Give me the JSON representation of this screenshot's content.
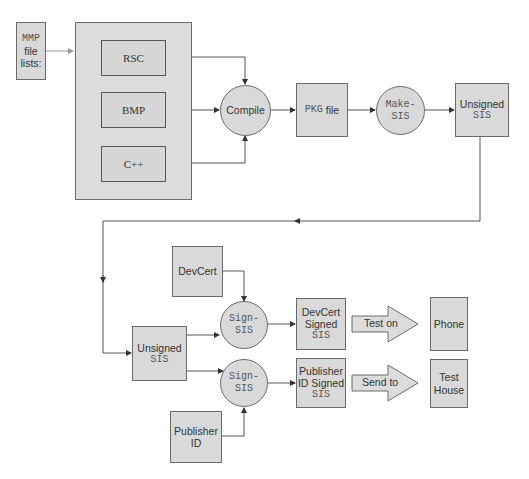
{
  "diagram": {
    "colors": {
      "node_fill": "#d9d9d9",
      "border": "#6b6b6b",
      "line": "#555555",
      "text": "#333333"
    },
    "nodes": {
      "mmp": {
        "line1": "MMP",
        "line2": "file",
        "line3": "lists:"
      },
      "rsc": {
        "label": "RSC"
      },
      "bmp": {
        "label": "BMP"
      },
      "cpp": {
        "label": "C++"
      },
      "compile": {
        "label": "Compile"
      },
      "pkg": {
        "mono": "PKG",
        "label": "file"
      },
      "makesis": {
        "line1": "Make-",
        "line2": "SIS"
      },
      "unsigned_top": {
        "line1": "Unsigned",
        "line2": "SIS"
      },
      "devcert": {
        "label": "DevCert"
      },
      "unsigned_bottom": {
        "line1": "Unsigned",
        "line2": "SIS"
      },
      "signsis_top": {
        "line1": "Sign-",
        "line2": "SIS"
      },
      "signsis_bottom": {
        "line1": "Sign-",
        "line2": "SIS"
      },
      "publisher_id": {
        "line1": "Publisher",
        "line2": "ID"
      },
      "devcert_signed": {
        "line1": "DevCert",
        "line2": "Signed",
        "line3": "SIS"
      },
      "publisher_signed": {
        "line1": "Publisher",
        "line2": "ID Signed",
        "line3": "SIS"
      },
      "phone": {
        "label": "Phone"
      },
      "test_house": {
        "line1": "Test",
        "line2": "House"
      }
    },
    "arrows": {
      "test_on": "Test on",
      "send_to": "Send to"
    }
  }
}
